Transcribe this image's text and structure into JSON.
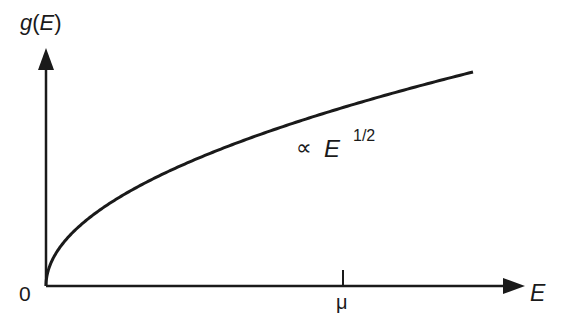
{
  "chart_data": {
    "type": "line",
    "title": "",
    "xlabel": "E",
    "ylabel": "g(E)",
    "origin_label": "0",
    "x_ticks": [
      {
        "label": "μ"
      }
    ],
    "annotation": {
      "prefix": "∝",
      "base": "E",
      "exponent": "1/2"
    },
    "series": [
      {
        "name": "g(E) ∝ E^(1/2)",
        "function": "sqrt"
      }
    ],
    "grid": false
  },
  "labels": {
    "y_axis": "g(E)",
    "x_axis": "E",
    "origin": "0",
    "mu": "μ",
    "prop": "∝",
    "base": "E",
    "exp": "1/2"
  }
}
